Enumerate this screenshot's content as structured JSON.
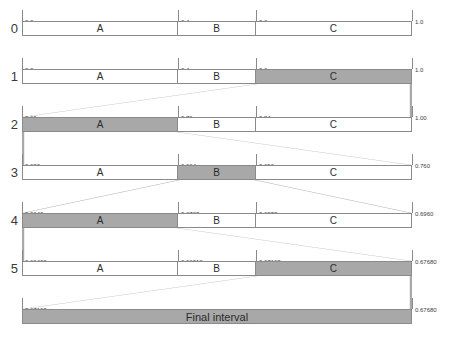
{
  "diagram": {
    "axis_min": 0.0,
    "axis_max": 1.0,
    "colors": {
      "highlight": "#a8a8a8",
      "border": "#8a8a8a",
      "connector": "#a8a8a8",
      "text": "#333333",
      "background": "#ffffff"
    },
    "final_label": "Final interval",
    "final_low": "0.67168",
    "final_high": "0.67680",
    "rows": [
      {
        "index": "0",
        "low": 0.0,
        "high": 1.0,
        "ticks": [
          "0.0",
          "0.4",
          "0.6",
          "1.0"
        ],
        "segments": [
          {
            "label": "A",
            "low": 0.0,
            "high": 0.4,
            "highlight": false
          },
          {
            "label": "B",
            "low": 0.4,
            "high": 0.6,
            "highlight": false
          },
          {
            "label": "C",
            "low": 0.6,
            "high": 1.0,
            "highlight": false
          }
        ],
        "selected": null
      },
      {
        "index": "1",
        "low": 0.0,
        "high": 1.0,
        "ticks": [
          "0.0",
          "0.4",
          "0.6",
          "1.0"
        ],
        "segments": [
          {
            "label": "A",
            "low": 0.0,
            "high": 0.4,
            "highlight": false
          },
          {
            "label": "B",
            "low": 0.4,
            "high": 0.6,
            "highlight": false
          },
          {
            "label": "C",
            "low": 0.6,
            "high": 1.0,
            "highlight": true
          }
        ],
        "selected": "C"
      },
      {
        "index": "2",
        "low": 0.6,
        "high": 1.0,
        "ticks": [
          "0.60",
          "0.76",
          "0.84",
          "1.00"
        ],
        "segments": [
          {
            "label": "A",
            "low": 0.6,
            "high": 0.76,
            "highlight": true
          },
          {
            "label": "B",
            "low": 0.76,
            "high": 0.84,
            "highlight": false
          },
          {
            "label": "C",
            "low": 0.84,
            "high": 1.0,
            "highlight": false
          }
        ],
        "selected": "A"
      },
      {
        "index": "3",
        "low": 0.6,
        "high": 0.76,
        "ticks": [
          "0.600",
          "0.664",
          "0.696",
          "0.760"
        ],
        "segments": [
          {
            "label": "A",
            "low": 0.6,
            "high": 0.664,
            "highlight": false
          },
          {
            "label": "B",
            "low": 0.664,
            "high": 0.696,
            "highlight": true
          },
          {
            "label": "C",
            "low": 0.696,
            "high": 0.76,
            "highlight": false
          }
        ],
        "selected": "B"
      },
      {
        "index": "4",
        "low": 0.664,
        "high": 0.696,
        "ticks": [
          "0.6640",
          "0.6768",
          "0.6832",
          "0.6960"
        ],
        "segments": [
          {
            "label": "A",
            "low": 0.664,
            "high": 0.6768,
            "highlight": true
          },
          {
            "label": "B",
            "low": 0.6768,
            "high": 0.6832,
            "highlight": false
          },
          {
            "label": "C",
            "low": 0.6832,
            "high": 0.696,
            "highlight": false
          }
        ],
        "selected": "A"
      },
      {
        "index": "5",
        "low": 0.664,
        "high": 0.6768,
        "ticks": [
          "0.66400",
          "0.66912",
          "0.67168",
          "0.67680"
        ],
        "segments": [
          {
            "label": "A",
            "low": 0.664,
            "high": 0.66912,
            "highlight": false
          },
          {
            "label": "B",
            "low": 0.66912,
            "high": 0.67168,
            "highlight": false
          },
          {
            "label": "C",
            "low": 0.67168,
            "high": 0.6768,
            "highlight": true
          }
        ],
        "selected": "C"
      }
    ]
  },
  "chart_data": {
    "type": "bar",
    "xlabel": "",
    "ylabel": "",
    "xlim": [
      0.0,
      1.0
    ],
    "grid": false,
    "legend": "none",
    "categories": [
      "A",
      "B",
      "C"
    ],
    "symbol_probabilities": [
      0.4,
      0.2,
      0.4
    ],
    "encoded_sequence": [
      "C",
      "A",
      "B",
      "A",
      "C"
    ],
    "series": [
      {
        "name": "row 0",
        "boundaries": [
          0.0,
          0.4,
          0.6,
          1.0
        ],
        "selected": null
      },
      {
        "name": "row 1",
        "boundaries": [
          0.0,
          0.4,
          0.6,
          1.0
        ],
        "selected": "C"
      },
      {
        "name": "row 2",
        "boundaries": [
          0.6,
          0.76,
          0.84,
          1.0
        ],
        "selected": "A"
      },
      {
        "name": "row 3",
        "boundaries": [
          0.6,
          0.664,
          0.696,
          0.76
        ],
        "selected": "B"
      },
      {
        "name": "row 4",
        "boundaries": [
          0.664,
          0.6768,
          0.6832,
          0.696
        ],
        "selected": "A"
      },
      {
        "name": "row 5",
        "boundaries": [
          0.664,
          0.66912,
          0.67168,
          0.6768
        ],
        "selected": "C"
      }
    ],
    "final_interval": [
      0.67168,
      0.6768
    ]
  }
}
